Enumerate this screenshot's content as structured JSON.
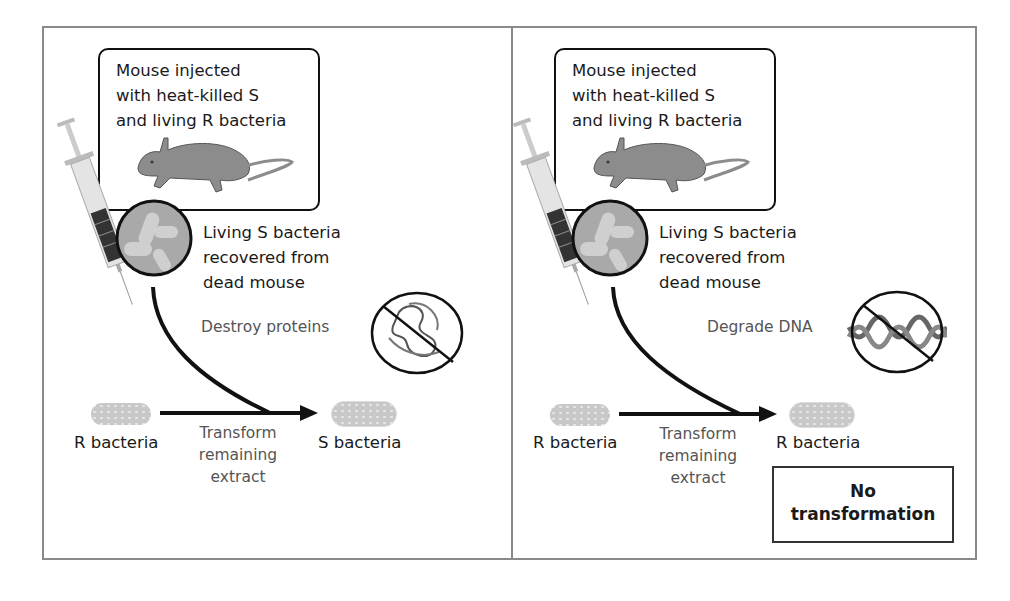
{
  "figure": {
    "colors": {
      "frame": "#8a8a8a",
      "arrow": "#111111",
      "bacteria": "#c8c8c8",
      "label_gray": "#555555"
    }
  },
  "panels": [
    {
      "id": "protein-destroyed",
      "callout_text": "Mouse injected\nwith heat-killed S\nand living R bacteria",
      "recovered_text": "Living S bacteria\nrecovered from\ndead mouse",
      "treatment_label": "Destroy proteins",
      "treatment_icon": "protein-prohibited-icon",
      "input_label": "R bacteria",
      "process_label": "Transform\nremaining\nextract",
      "output_label": "S bacteria"
    },
    {
      "id": "dna-degraded",
      "callout_text": "Mouse injected\nwith heat-killed S\nand living R bacteria",
      "recovered_text": "Living S bacteria\nrecovered from\ndead mouse",
      "treatment_label": "Degrade DNA",
      "treatment_icon": "dna-prohibited-icon",
      "input_label": "R bacteria",
      "process_label": "Transform\nremaining\nextract",
      "output_label": "R bacteria",
      "result_label": "No\ntransformation"
    }
  ]
}
